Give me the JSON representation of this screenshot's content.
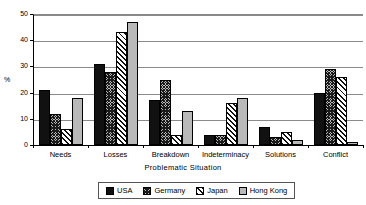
{
  "chart_data": {
    "type": "bar",
    "title": "",
    "subtitle": "",
    "xlabel": "Problematic  Situation",
    "ylabel": "%",
    "ylim": [
      0,
      50
    ],
    "yticks": [
      0,
      10,
      20,
      30,
      40,
      50
    ],
    "ytick_labels": [
      "0",
      "10",
      "20",
      "30",
      "40",
      "50"
    ],
    "grid": true,
    "grid_axis": "y",
    "legend_position": "bottom",
    "categories": [
      "Needs",
      "Losses",
      "Breakdown",
      "Indeterminacy",
      "Solutions",
      "Conflict"
    ],
    "series": [
      {
        "name": "USA",
        "color": "#111111",
        "pattern": "solid-black",
        "values": [
          21,
          31,
          17,
          4,
          7,
          20
        ]
      },
      {
        "name": "Germany",
        "color": "#b8b8b8",
        "pattern": "crosshatch",
        "values": [
          12,
          28,
          25,
          4,
          3,
          29
        ]
      },
      {
        "name": "Japan",
        "color": "#ffffff",
        "pattern": "diagonal",
        "values": [
          6,
          43,
          4,
          16,
          5,
          26
        ]
      },
      {
        "name": "Hong Kong",
        "color": "#b9b9b9",
        "pattern": "solid-gray",
        "values": [
          18,
          47,
          13,
          18,
          2,
          1
        ]
      }
    ]
  },
  "legend": {
    "items": [
      {
        "label": "USA"
      },
      {
        "label": "Germany"
      },
      {
        "label": "Japan"
      },
      {
        "label": "Hong Kong"
      }
    ]
  }
}
